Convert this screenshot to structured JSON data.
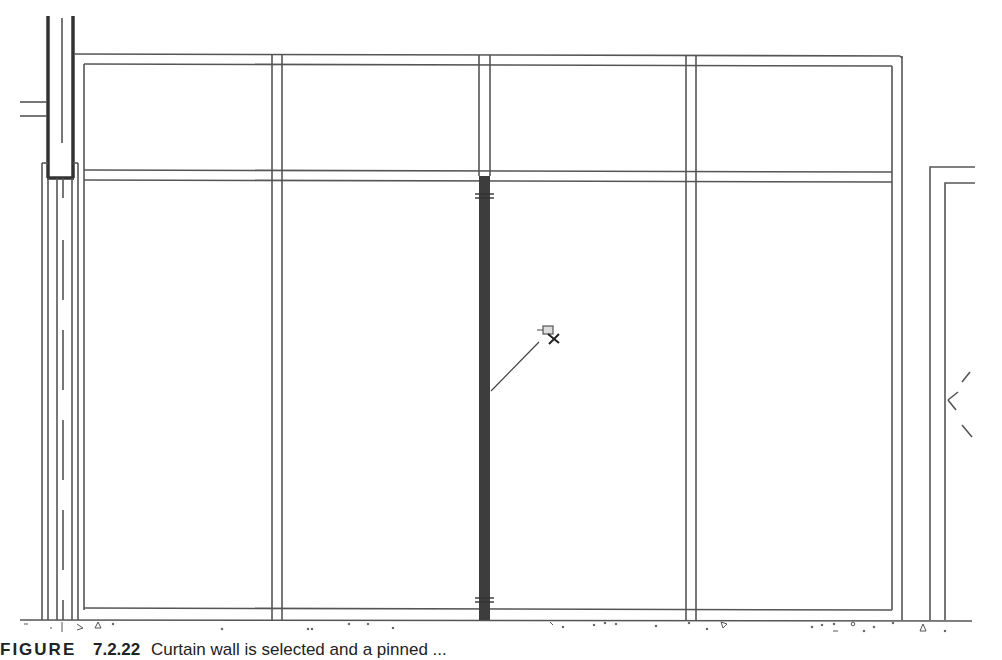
{
  "figure": {
    "label": "FIGURE",
    "number": "7.2.22",
    "caption_text": "Curtain wall is selected and a pinned ..."
  },
  "drawing": {
    "type": "curtain-wall-elevation",
    "colors": {
      "line": "#555555",
      "heavy_line": "#333333",
      "selected_mullion": "#3d3d3d",
      "background": "#ffffff"
    },
    "panels_count": 4,
    "selected_element": "center-mullion",
    "pin_icon": "pushpin-with-x-icon",
    "rows": 2
  }
}
